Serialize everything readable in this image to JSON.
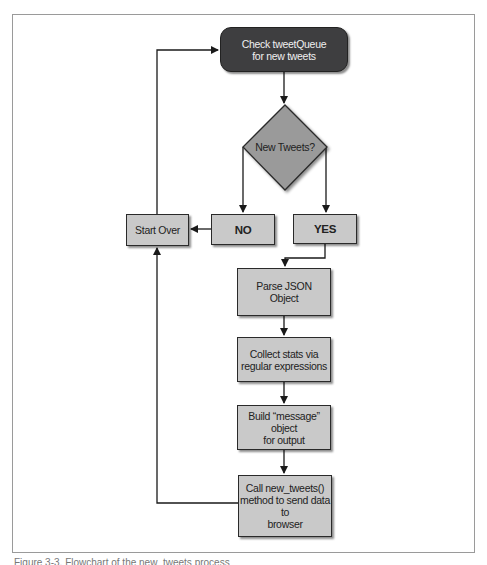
{
  "diagram": {
    "type": "flowchart",
    "nodes": {
      "check_queue": {
        "label": "Check tweetQueue\nfor new tweets",
        "line1": "Check tweetQueue",
        "line2": "for new tweets",
        "shape": "rounded-rect",
        "fill": "#3e3e40"
      },
      "decision": {
        "label": "New Tweets?",
        "shape": "diamond",
        "fill": "#9a9a9a"
      },
      "no": {
        "label": "NO",
        "shape": "rect",
        "fill": "#c9c9c9"
      },
      "yes": {
        "label": "YES",
        "shape": "rect",
        "fill": "#c9c9c9"
      },
      "start_over": {
        "label": "Start Over",
        "shape": "rect",
        "fill": "#c9c9c9"
      },
      "parse_json": {
        "label": "Parse JSON Object",
        "line1": "Parse JSON",
        "line2": "Object",
        "shape": "rect",
        "fill": "#c9c9c9"
      },
      "collect_stats": {
        "label": "Collect stats via regular expressions",
        "line1": "Collect stats via",
        "line2": "regular expressions",
        "shape": "rect",
        "fill": "#c9c9c9"
      },
      "build_message": {
        "label": "Build “message” object for output",
        "line1": "Build “message” object",
        "line2": "for output",
        "shape": "rect",
        "fill": "#c9c9c9"
      },
      "call_new_tweets": {
        "label": "Call new_tweets() method to send data to browser",
        "line1": "Call new_tweets()",
        "line2": "method to send data to",
        "line3": "browser",
        "shape": "rect",
        "fill": "#c9c9c9"
      }
    },
    "edges": [
      {
        "from": "check_queue",
        "to": "decision"
      },
      {
        "from": "decision",
        "to": "no"
      },
      {
        "from": "decision",
        "to": "yes"
      },
      {
        "from": "no",
        "to": "start_over"
      },
      {
        "from": "start_over",
        "to": "check_queue"
      },
      {
        "from": "yes",
        "to": "parse_json"
      },
      {
        "from": "parse_json",
        "to": "collect_stats"
      },
      {
        "from": "collect_stats",
        "to": "build_message"
      },
      {
        "from": "build_message",
        "to": "call_new_tweets"
      },
      {
        "from": "call_new_tweets",
        "to": "start_over"
      }
    ]
  },
  "caption": "Figure 3-3. Flowchart of the new_tweets process"
}
